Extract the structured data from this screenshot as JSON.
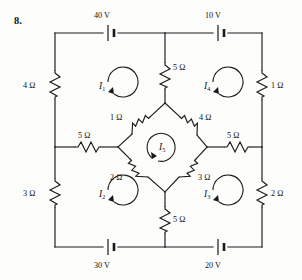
{
  "figure": {
    "problem_number": "8.",
    "type": "circuit-diagram"
  },
  "sources": [
    {
      "id": "src-top-left",
      "label": "40 V",
      "orientation": "horizontal",
      "position": "top-left"
    },
    {
      "id": "src-top-right",
      "label": "10 V",
      "orientation": "horizontal",
      "position": "top-right"
    },
    {
      "id": "src-bottom-left",
      "label": "30 V",
      "orientation": "horizontal",
      "position": "bottom-left"
    },
    {
      "id": "src-bottom-right",
      "label": "20 V",
      "orientation": "horizontal",
      "position": "bottom-right"
    }
  ],
  "resistors": [
    {
      "id": "res-left-upper",
      "label": "4 Ω",
      "orientation": "vertical",
      "position": "left-rail-upper"
    },
    {
      "id": "res-left-lower",
      "label": "3 Ω",
      "orientation": "vertical",
      "position": "left-rail-lower"
    },
    {
      "id": "res-right-upper",
      "label": "1 Ω",
      "orientation": "vertical",
      "position": "right-rail-upper"
    },
    {
      "id": "res-right-lower",
      "label": "2 Ω",
      "orientation": "vertical",
      "position": "right-rail-lower"
    },
    {
      "id": "res-top-center",
      "label": "5 Ω",
      "orientation": "vertical",
      "position": "top-center-branch"
    },
    {
      "id": "res-bottom-center",
      "label": "5 Ω",
      "orientation": "vertical",
      "position": "bottom-center-branch"
    },
    {
      "id": "res-mid-left",
      "label": "5 Ω",
      "orientation": "horizontal",
      "position": "middle-left-branch"
    },
    {
      "id": "res-mid-right",
      "label": "5 Ω",
      "orientation": "horizontal",
      "position": "middle-right-branch"
    },
    {
      "id": "res-diamond-tl",
      "label": "1 Ω",
      "orientation": "diagonal",
      "position": "diamond-top-left"
    },
    {
      "id": "res-diamond-tr",
      "label": "4 Ω",
      "orientation": "diagonal",
      "position": "diamond-top-right"
    },
    {
      "id": "res-diamond-bl",
      "label": "2 Ω",
      "orientation": "diagonal",
      "position": "diamond-bottom-left"
    },
    {
      "id": "res-diamond-br",
      "label": "3 Ω",
      "orientation": "diagonal",
      "position": "diamond-bottom-right"
    }
  ],
  "mesh_currents": [
    {
      "id": "mesh-1",
      "symbol": "I",
      "subscript": "1",
      "direction": "clockwise",
      "position": "upper-left"
    },
    {
      "id": "mesh-2",
      "symbol": "I",
      "subscript": "2",
      "direction": "clockwise",
      "position": "lower-left"
    },
    {
      "id": "mesh-3",
      "symbol": "I",
      "subscript": "3",
      "direction": "clockwise",
      "position": "lower-right"
    },
    {
      "id": "mesh-4",
      "symbol": "I",
      "subscript": "4",
      "direction": "clockwise",
      "position": "upper-right"
    },
    {
      "id": "mesh-5",
      "symbol": "I",
      "subscript": "5",
      "direction": "clockwise",
      "position": "center-diamond"
    }
  ]
}
